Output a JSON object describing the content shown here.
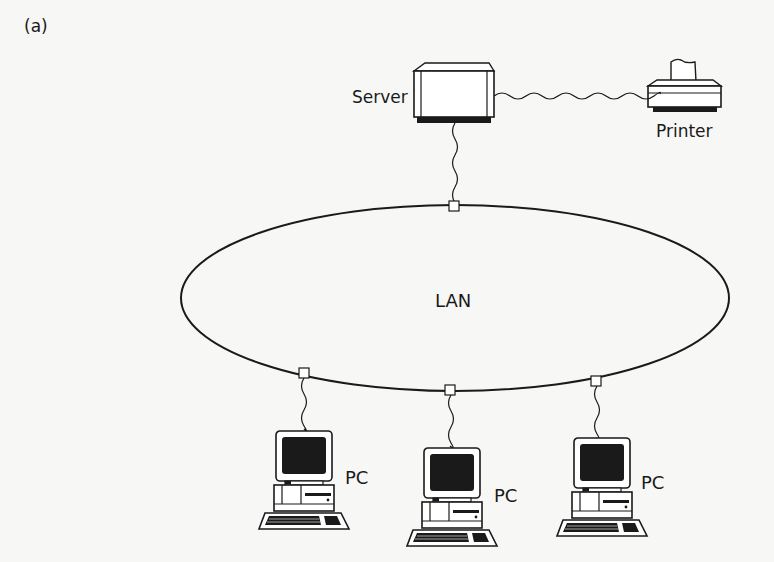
{
  "figure": {
    "panel_label": "(a)",
    "colors": {
      "stroke": "#1a1a1a",
      "background": "#f7f7f5"
    }
  },
  "network": {
    "label": "LAN",
    "topology": "ring"
  },
  "nodes": {
    "server": {
      "label": "Server",
      "icon": "server-icon"
    },
    "printer": {
      "label": "Printer",
      "icon": "printer-icon"
    },
    "pcs": [
      {
        "label": "PC",
        "icon": "pc-icon"
      },
      {
        "label": "PC",
        "icon": "pc-icon"
      },
      {
        "label": "PC",
        "icon": "pc-icon"
      }
    ]
  },
  "connections": [
    {
      "from": "Server",
      "to": "Printer"
    },
    {
      "from": "Server",
      "to": "LAN"
    },
    {
      "from": "PC",
      "to": "LAN"
    },
    {
      "from": "PC",
      "to": "LAN"
    },
    {
      "from": "PC",
      "to": "LAN"
    }
  ]
}
